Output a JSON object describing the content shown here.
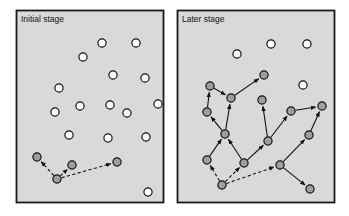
{
  "figure": {
    "background_color": "#ffffff",
    "panel_fill": "#d9d9d9",
    "panel_border_color": "#1a1a1a",
    "node_filled_color": "#9e9e9e",
    "node_hollow_color": "#ffffff",
    "node_stroke_color": "#111111",
    "edge_color": "#111111",
    "node_radius": 4.1
  },
  "panels": [
    {
      "id": "initial-stage",
      "label": "Initial stage",
      "x": 16,
      "y": 10,
      "width": 147,
      "height": 192,
      "label_x": 21,
      "label_y": 22,
      "nodes": [
        {
          "id": "L1",
          "x": 57,
          "y": 179,
          "state": "filled"
        },
        {
          "id": "L2",
          "x": 37,
          "y": 157,
          "state": "filled"
        },
        {
          "id": "L3",
          "x": 72,
          "y": 165,
          "state": "filled"
        },
        {
          "id": "L4",
          "x": 117,
          "y": 162,
          "state": "filled"
        },
        {
          "id": "L5",
          "x": 102,
          "y": 43,
          "state": "hollow"
        },
        {
          "id": "L6",
          "x": 136,
          "y": 43,
          "state": "hollow"
        },
        {
          "id": "L7",
          "x": 83,
          "y": 57,
          "state": "hollow"
        },
        {
          "id": "L8",
          "x": 113,
          "y": 75,
          "state": "hollow"
        },
        {
          "id": "L9",
          "x": 59,
          "y": 88,
          "state": "hollow"
        },
        {
          "id": "L10",
          "x": 145,
          "y": 78,
          "state": "hollow"
        },
        {
          "id": "L11",
          "x": 80,
          "y": 106,
          "state": "hollow"
        },
        {
          "id": "L12",
          "x": 110,
          "y": 105,
          "state": "hollow"
        },
        {
          "id": "L13",
          "x": 158,
          "y": 104,
          "state": "hollow"
        },
        {
          "id": "L14",
          "x": 55,
          "y": 112,
          "state": "hollow"
        },
        {
          "id": "L15",
          "x": 127,
          "y": 113,
          "state": "hollow"
        },
        {
          "id": "L16",
          "x": 69,
          "y": 135,
          "state": "hollow"
        },
        {
          "id": "L17",
          "x": 108,
          "y": 138,
          "state": "hollow"
        },
        {
          "id": "L18",
          "x": 146,
          "y": 137,
          "state": "hollow"
        },
        {
          "id": "L19",
          "x": 148,
          "y": 192,
          "state": "hollow"
        }
      ],
      "edges": [
        {
          "from": "L1",
          "to": "L2",
          "style": "dashed",
          "arrow": true
        },
        {
          "from": "L1",
          "to": "L3",
          "style": "dashed",
          "arrow": true
        },
        {
          "from": "L1",
          "to": "L4",
          "style": "dashed",
          "arrow": true
        }
      ]
    },
    {
      "id": "later-stage",
      "label": "Later stage",
      "x": 177,
      "y": 10,
      "width": 157,
      "height": 192,
      "label_x": 182,
      "label_y": 22,
      "nodes": [
        {
          "id": "R1",
          "x": 222,
          "y": 185,
          "state": "filled"
        },
        {
          "id": "R2",
          "x": 207,
          "y": 160,
          "state": "filled"
        },
        {
          "id": "R3",
          "x": 244,
          "y": 163,
          "state": "filled"
        },
        {
          "id": "R4",
          "x": 280,
          "y": 165,
          "state": "filled"
        },
        {
          "id": "R5",
          "x": 310,
          "y": 189,
          "state": "filled"
        },
        {
          "id": "R6",
          "x": 309,
          "y": 135,
          "state": "filled"
        },
        {
          "id": "R7",
          "x": 225,
          "y": 134,
          "state": "filled"
        },
        {
          "id": "R8",
          "x": 268,
          "y": 141,
          "state": "filled"
        },
        {
          "id": "R9",
          "x": 291,
          "y": 111,
          "state": "filled"
        },
        {
          "id": "R10",
          "x": 322,
          "y": 106,
          "state": "filled"
        },
        {
          "id": "R11",
          "x": 262,
          "y": 100,
          "state": "filled"
        },
        {
          "id": "R12",
          "x": 231,
          "y": 98,
          "state": "filled"
        },
        {
          "id": "R13",
          "x": 207,
          "y": 112,
          "state": "filled"
        },
        {
          "id": "R14",
          "x": 210,
          "y": 86,
          "state": "filled"
        },
        {
          "id": "R15",
          "x": 264,
          "y": 75,
          "state": "filled"
        },
        {
          "id": "R16",
          "x": 237,
          "y": 54,
          "state": "hollow"
        },
        {
          "id": "R17",
          "x": 271,
          "y": 44,
          "state": "hollow"
        },
        {
          "id": "R18",
          "x": 307,
          "y": 44,
          "state": "hollow"
        },
        {
          "id": "R19",
          "x": 303,
          "y": 85,
          "state": "hollow"
        }
      ],
      "edges": [
        {
          "from": "R1",
          "to": "R2",
          "style": "dashed",
          "arrow": true
        },
        {
          "from": "R1",
          "to": "R3",
          "style": "dashed",
          "arrow": true
        },
        {
          "from": "R1",
          "to": "R4",
          "style": "dashed",
          "arrow": true
        },
        {
          "from": "R2",
          "to": "R7",
          "style": "solid",
          "arrow": true
        },
        {
          "from": "R3",
          "to": "R7",
          "style": "solid",
          "arrow": true
        },
        {
          "from": "R3",
          "to": "R8",
          "style": "solid",
          "arrow": true
        },
        {
          "from": "R4",
          "to": "R5",
          "style": "solid",
          "arrow": true
        },
        {
          "from": "R4",
          "to": "R6",
          "style": "solid",
          "arrow": true
        },
        {
          "from": "R6",
          "to": "R10",
          "style": "solid",
          "arrow": true
        },
        {
          "from": "R8",
          "to": "R9",
          "style": "solid",
          "arrow": true
        },
        {
          "from": "R8",
          "to": "R11",
          "style": "solid",
          "arrow": true
        },
        {
          "from": "R9",
          "to": "R10",
          "style": "solid",
          "arrow": true
        },
        {
          "from": "R7",
          "to": "R12",
          "style": "solid",
          "arrow": true
        },
        {
          "from": "R7",
          "to": "R13",
          "style": "solid",
          "arrow": true
        },
        {
          "from": "R13",
          "to": "R14",
          "style": "solid",
          "arrow": true
        },
        {
          "from": "R14",
          "to": "R12",
          "style": "solid",
          "arrow": true
        },
        {
          "from": "R12",
          "to": "R15",
          "style": "solid",
          "arrow": true
        }
      ]
    }
  ]
}
